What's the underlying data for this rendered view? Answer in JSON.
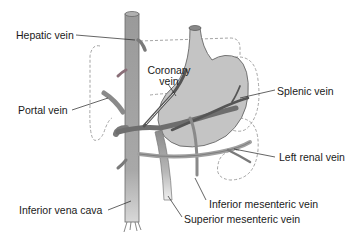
{
  "diagram": {
    "colors": {
      "vessel_fill": "#9c9c9c",
      "vessel_dark": "#6e6e6e",
      "vessel_light": "#c6c6c6",
      "stomach_fill": "#c4c4c4",
      "outline": "#555555",
      "dashed_outline": "#9a9a9a",
      "hepatic_stub_tint": "#b98a95",
      "leader_line": "#222222",
      "text": "#1a1a1a",
      "background": "#ffffff"
    },
    "labels": {
      "hepatic_vein": "Hepatic vein",
      "coronary_vein_line1": "Coronary",
      "coronary_vein_line2": "vein",
      "splenic_vein": "Splenic vein",
      "portal_vein": "Portal vein",
      "left_renal_vein": "Left renal vein",
      "inferior_mesenteric_vein": "Inferior mesenteric vein",
      "inferior_vena_cava": "Inferior vena cava",
      "superior_mesenteric_vein": "Superior mesenteric vein"
    }
  }
}
